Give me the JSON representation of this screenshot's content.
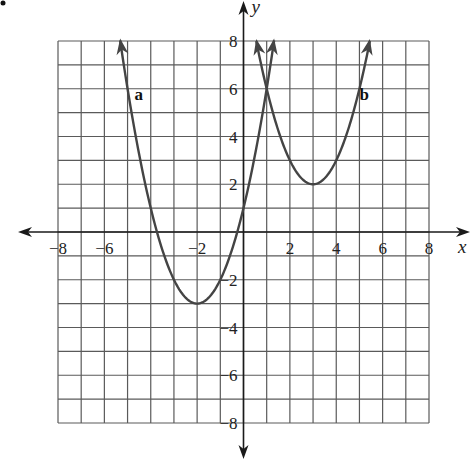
{
  "chart_data": {
    "type": "line",
    "title": "",
    "xlabel": "x",
    "ylabel": "y",
    "xlim": [
      -8,
      8
    ],
    "ylim": [
      -8,
      8
    ],
    "grid": true,
    "grid_step": 1,
    "x_ticks": [
      -8,
      -6,
      -2,
      2,
      4,
      6,
      8
    ],
    "x_tick_labels": [
      "−8",
      "−6",
      "−2",
      "2",
      "4",
      "6",
      "8"
    ],
    "y_ticks": [
      8,
      6,
      4,
      2,
      -2,
      -4,
      -6,
      -8
    ],
    "y_tick_labels": [
      "8",
      "6",
      "4",
      "2",
      "−2",
      "−4",
      "−6",
      "−8"
    ],
    "series": [
      {
        "name": "a",
        "equation": "y = (x + 2)^2 - 3",
        "vertex": [
          -2,
          -3
        ],
        "points": [
          [
            -5.32,
            8
          ],
          [
            -5,
            6
          ],
          [
            -4,
            1
          ],
          [
            -3,
            -2
          ],
          [
            -2,
            -3
          ],
          [
            -1,
            -2
          ],
          [
            0,
            1
          ],
          [
            1,
            6
          ],
          [
            1.32,
            8
          ]
        ],
        "arrows_at_ends": true,
        "color": "#444444"
      },
      {
        "name": "b",
        "equation": "y = (x - 3)^2 + 2",
        "vertex": [
          3,
          2
        ],
        "points": [
          [
            0.55,
            8
          ],
          [
            1,
            6
          ],
          [
            2,
            3
          ],
          [
            3,
            2
          ],
          [
            4,
            3
          ],
          [
            5,
            6
          ],
          [
            5.45,
            8
          ]
        ],
        "arrows_at_ends": true,
        "color": "#444444"
      }
    ],
    "annotations": [
      {
        "text": "a",
        "x": -4.7,
        "y": 5.8
      },
      {
        "text": "b",
        "x": 5.0,
        "y": 5.8
      }
    ]
  },
  "colors": {
    "grid": "#5a5a5a",
    "axis": "#1a1a1a",
    "curve": "#444444",
    "background": "#ffffff"
  }
}
